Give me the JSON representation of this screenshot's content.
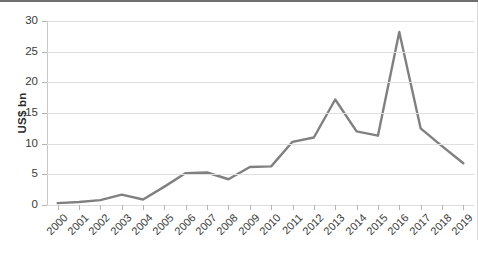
{
  "chart_data": {
    "type": "line",
    "title": "",
    "subtitle": "",
    "xlabel": "",
    "ylabel": "US$ bn",
    "categories": [
      "2000",
      "2001",
      "2002",
      "2003",
      "2004",
      "2005",
      "2006",
      "2007",
      "2008",
      "2009",
      "2010",
      "2011",
      "2012",
      "2013",
      "2014",
      "2015",
      "2016",
      "2017",
      "2018",
      "2019"
    ],
    "values": [
      0.3,
      0.5,
      0.8,
      1.7,
      0.9,
      3.0,
      5.2,
      5.3,
      4.2,
      6.2,
      6.3,
      10.3,
      11.0,
      17.2,
      12.0,
      11.3,
      28.2,
      12.5,
      9.6,
      6.8
    ],
    "series": [
      {
        "name": "US$ bn",
        "color": "#808080",
        "values": [
          0.3,
          0.5,
          0.8,
          1.7,
          0.9,
          3.0,
          5.2,
          5.3,
          4.2,
          6.2,
          6.3,
          10.3,
          11.0,
          17.2,
          12.0,
          11.3,
          28.2,
          12.5,
          9.6,
          6.8
        ]
      }
    ],
    "ylim": [
      0,
      30
    ],
    "yticks": [
      0,
      5,
      10,
      15,
      20,
      25,
      30
    ],
    "ytick_labels": [
      "0",
      "5",
      "10",
      "15",
      "20",
      "25",
      "30"
    ],
    "grid": true,
    "grid_axis": "y",
    "legend": false,
    "legend_position": "none",
    "xtick_rotation": -45,
    "annotations": []
  },
  "style": {
    "line_color": "#808080",
    "grid_color": "#dedede",
    "axis_color": "#c8c8c8",
    "text_color": "#3a3a3a",
    "border_color": "#6f6f6f",
    "background": "#ffffff"
  }
}
